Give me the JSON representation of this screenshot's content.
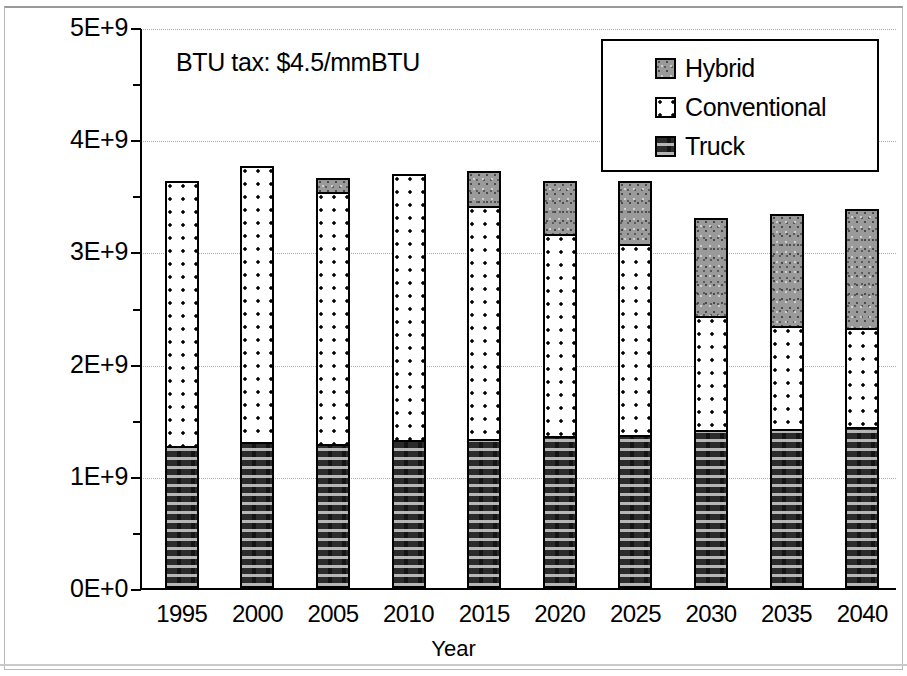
{
  "annotation": {
    "text": "BTU tax:  $4.5/mmBTU"
  },
  "legend": {
    "items": [
      {
        "label": "Hybrid",
        "swatch": "hybrid-swatch"
      },
      {
        "label": "Conventional",
        "swatch": "conventional-swatch"
      },
      {
        "label": "Truck",
        "swatch": "truck-swatch"
      }
    ]
  },
  "axes": {
    "x_title": "Year",
    "y_ticks": [
      "0E+0",
      "1E+9",
      "2E+9",
      "3E+9",
      "4E+9",
      "5E+9"
    ],
    "x_ticks": [
      "1995",
      "2000",
      "2005",
      "2010",
      "2015",
      "2020",
      "2025",
      "2030",
      "2035",
      "2040"
    ]
  },
  "colors": {
    "truck": "#2b2b2b",
    "conventional": "#ffffff",
    "hybrid": "#9a9a9a",
    "axis": "#000000",
    "grid": "#b0b0b0"
  },
  "chart_data": {
    "type": "bar",
    "title": "",
    "subtitle": "",
    "annotation": "BTU tax:  $4.5/mmBTU",
    "xlabel": "Year",
    "ylabel": "",
    "stacked": true,
    "grid": true,
    "legend_position": "top-right",
    "ylim": [
      0,
      5000000000
    ],
    "ytick_values": [
      0,
      1000000000,
      2000000000,
      3000000000,
      4000000000,
      5000000000
    ],
    "ytick_labels": [
      "0E+0",
      "1E+9",
      "2E+9",
      "3E+9",
      "4E+9",
      "5E+9"
    ],
    "categories": [
      "1995",
      "2000",
      "2005",
      "2010",
      "2015",
      "2020",
      "2025",
      "2030",
      "2035",
      "2040"
    ],
    "series": [
      {
        "name": "Truck",
        "values": [
          1250000000,
          1280000000,
          1270000000,
          1300000000,
          1310000000,
          1340000000,
          1350000000,
          1390000000,
          1400000000,
          1420000000
        ]
      },
      {
        "name": "Conventional",
        "values": [
          2360000000,
          2460000000,
          2240000000,
          2370000000,
          2080000000,
          1800000000,
          1700000000,
          1020000000,
          920000000,
          880000000
        ]
      },
      {
        "name": "Hybrid",
        "values": [
          0,
          0,
          130000000,
          0,
          310000000,
          470000000,
          560000000,
          870000000,
          1000000000,
          1060000000
        ]
      }
    ],
    "totals": [
      3610000000,
      3740000000,
      3640000000,
      3670000000,
      3700000000,
      3610000000,
      3610000000,
      3280000000,
      3320000000,
      3360000000
    ]
  }
}
